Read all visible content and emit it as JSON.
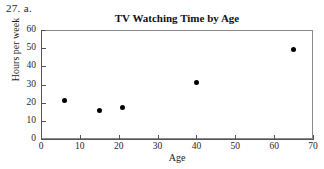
{
  "problem_label": "27. a.",
  "chart_data": {
    "type": "scatter",
    "title": "TV Watching Time by Age",
    "xlabel": "Age",
    "ylabel": "Hours per week",
    "xlim": [
      0,
      70
    ],
    "ylim": [
      0,
      60
    ],
    "xticks": [
      0,
      10,
      20,
      30,
      40,
      50,
      60,
      70
    ],
    "yticks": [
      0,
      10,
      20,
      30,
      40,
      50,
      60
    ],
    "grid": false,
    "legend": null,
    "marker": {
      "shape": "filled-circle",
      "color": "#000000",
      "size_px": 5
    },
    "points": [
      {
        "x": 6,
        "y": 21
      },
      {
        "x": 15,
        "y": 15.5
      },
      {
        "x": 21,
        "y": 17.5
      },
      {
        "x": 40,
        "y": 31
      },
      {
        "x": 65,
        "y": 49
      }
    ],
    "x": [
      6,
      15,
      21,
      40,
      65
    ],
    "values": [
      21,
      15.5,
      17.5,
      31,
      49
    ]
  }
}
